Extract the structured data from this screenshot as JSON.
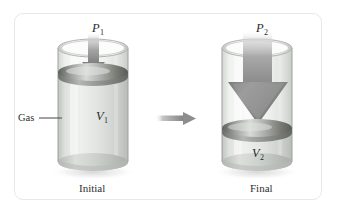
{
  "figure": {
    "border_color": "#e8e8e8",
    "background_color": "#ffffff"
  },
  "labels": {
    "pressure_initial": "P",
    "pressure_initial_sub": "1",
    "pressure_final": "P",
    "pressure_final_sub": "2",
    "volume_initial": "V",
    "volume_initial_sub": "1",
    "volume_final": "V",
    "volume_final_sub": "2",
    "gas": "Gas",
    "caption_left": "Initial",
    "caption_right": "Final"
  },
  "panels": [
    {
      "name": "initial",
      "caption": "Initial",
      "pressure_label": "P1",
      "volume_label": "V1",
      "piston_y": 72,
      "gas_top": 72,
      "gas_bottom": 168,
      "arrow_width": "narrow",
      "arrow_color": "#9d9d9d"
    },
    {
      "name": "final",
      "caption": "Final",
      "pressure_label": "P2",
      "volume_label": "V2",
      "piston_y": 128,
      "gas_top": 128,
      "gas_bottom": 168,
      "arrow_width": "wide",
      "arrow_color": "#8f8f8f"
    }
  ],
  "transition": {
    "name": "transition-arrow",
    "direction": "right",
    "color": "#999999"
  },
  "colors": {
    "glass_light": "#f2f3f2",
    "glass_mid": "#dcdedc",
    "glass_edge": "#b9bcb9",
    "piston_dark": "#6f716f",
    "piston_light": "#cfd1cf",
    "arrow_gray": "#9a9a9a",
    "text": "#2a2a2a"
  }
}
